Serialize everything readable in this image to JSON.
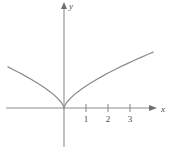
{
  "figure": {
    "width": 173,
    "height": 154,
    "background": "#ffffff",
    "line_color": "#8d8d8d",
    "curve_color": "#8c8c8c",
    "label_color": "#4a4a4a"
  },
  "axes": {
    "x_label": "x",
    "y_label": "y",
    "origin_px": {
      "x": 64,
      "y": 108
    },
    "unit_px": 22,
    "x_axis": {
      "start_px": 6,
      "end_px": 155,
      "y_px": 108
    },
    "y_axis": {
      "top_px": 3,
      "bottom_px": 147,
      "x_px": 64
    },
    "x_ticks": [
      {
        "label": "1",
        "value": 1,
        "px": 86
      },
      {
        "label": "2",
        "value": 2,
        "px": 108
      },
      {
        "label": "3",
        "value": 3,
        "px": 130
      }
    ],
    "y_ticks": []
  },
  "chart_data": {
    "type": "line",
    "title": "",
    "subtitle": "",
    "xlabel": "x",
    "ylabel": "y",
    "xlim": [
      -2.6,
      4.2
    ],
    "ylim": [
      -1.8,
      4.8
    ],
    "grid": false,
    "legend": null,
    "annotations": [],
    "series": [
      {
        "name": "y = x^(2/3)",
        "description": "cusp curve with vertex at the origin, symmetric about the y-axis",
        "x": [
          -2.55,
          -2.3,
          -2.0,
          -1.75,
          -1.5,
          -1.25,
          -1.0,
          -0.8,
          -0.6,
          -0.45,
          -0.3,
          -0.2,
          -0.12,
          -0.06,
          -0.02,
          0.0,
          0.02,
          0.06,
          0.12,
          0.2,
          0.3,
          0.45,
          0.6,
          0.8,
          1.0,
          1.25,
          1.5,
          1.75,
          2.0,
          2.3,
          2.6,
          2.9,
          3.2,
          3.5,
          3.8,
          4.05
        ],
        "y": [
          1.87,
          1.74,
          1.59,
          1.45,
          1.31,
          1.16,
          1.0,
          0.86,
          0.71,
          0.59,
          0.45,
          0.34,
          0.24,
          0.15,
          0.07,
          0.0,
          0.07,
          0.15,
          0.24,
          0.34,
          0.45,
          0.59,
          0.71,
          0.86,
          1.0,
          1.16,
          1.31,
          1.45,
          1.59,
          1.74,
          1.89,
          2.03,
          2.17,
          2.3,
          2.43,
          2.54
        ]
      }
    ]
  }
}
